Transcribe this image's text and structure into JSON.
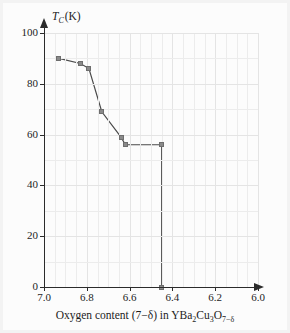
{
  "figure": {
    "caption_present": false
  },
  "axes": {
    "y_label_main": "T",
    "y_label_sub": "C",
    "y_label_unit": "(K)",
    "y_ticks": [
      "0",
      "20",
      "40",
      "60",
      "80",
      "100"
    ],
    "y_tick_values": [
      0,
      20,
      40,
      60,
      80,
      100
    ],
    "x_ticks": [
      "7.0",
      "6.8",
      "6.6",
      "6.4",
      "6.2",
      "6.0"
    ],
    "x_tick_values": [
      7.0,
      6.8,
      6.6,
      6.4,
      6.2,
      6.0
    ],
    "x_label_prefix": "Oxygen content (7−δ) in YBa",
    "x_label_sub1": "2",
    "x_label_mid1": "Cu",
    "x_label_sub2": "3",
    "x_label_mid2": "O",
    "x_label_sub3": "7−δ"
  },
  "colors": {
    "axis": "#2b2b2b",
    "grid_minor": "#ececec",
    "grid_major": "#e4e4e4",
    "line": "#4a4a4a",
    "marker_fill": "#8a8a8a",
    "marker_stroke": "#6e6e6e",
    "background": "#fcfcfc",
    "text": "#1c1c1c"
  },
  "chart_data": {
    "type": "line",
    "title": "",
    "xlabel": "Oxygen content (7−δ) in YBa2Cu3O7−δ",
    "ylabel": "T_C (K)",
    "xlim": [
      7.0,
      6.0
    ],
    "ylim": [
      0,
      100
    ],
    "x_axis_reversed": true,
    "grid": true,
    "grid_minor_x_step": 0.05,
    "grid_major_x_step": 0.2,
    "grid_minor_y_step": 10,
    "grid_major_y_step": 20,
    "legend": null,
    "marker": "square",
    "series": [
      {
        "name": "Tc vs oxygen content",
        "x": [
          6.93,
          6.83,
          6.79,
          6.73,
          6.64,
          6.62,
          6.45,
          6.45
        ],
        "y": [
          90,
          88,
          86,
          69,
          59,
          56,
          56,
          0
        ]
      }
    ],
    "points": [
      {
        "x": 6.93,
        "y": 90
      },
      {
        "x": 6.83,
        "y": 88
      },
      {
        "x": 6.79,
        "y": 86
      },
      {
        "x": 6.73,
        "y": 69
      },
      {
        "x": 6.64,
        "y": 59
      },
      {
        "x": 6.62,
        "y": 56
      },
      {
        "x": 6.45,
        "y": 56
      },
      {
        "x": 6.45,
        "y": 0
      }
    ]
  }
}
